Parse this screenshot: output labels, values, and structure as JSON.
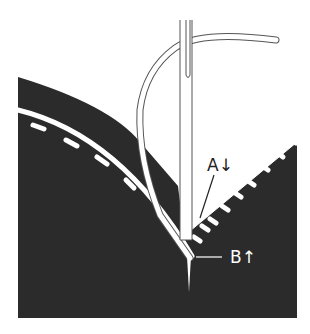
{
  "diagram": {
    "colors": {
      "fabric": "#2b2b2b",
      "background": "#ffffff",
      "stitch": "#ffffff",
      "outline": "#555555"
    },
    "labels": {
      "a": "A↓",
      "b": "B↑"
    }
  }
}
